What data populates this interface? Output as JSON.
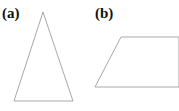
{
  "figure": {
    "width": 179,
    "height": 111,
    "background_color": "#ffffff",
    "stroke_color": "#a8a8a8",
    "stroke_width": 1,
    "label_color": "#111111"
  },
  "panels": [
    {
      "id": "a",
      "label": "(a)",
      "shape_name": "triangle",
      "label_position": {
        "x": 2,
        "y": 6
      },
      "points": "43,12 73,101 14,101",
      "closed": true,
      "clipped": false
    },
    {
      "id": "b",
      "label": "(b)",
      "shape_name": "trapezoid",
      "label_position": {
        "x": 95,
        "y": 6
      },
      "points": "95,87 121,37 179,37 179,87 95,87",
      "closed": false,
      "clipped": true
    }
  ]
}
